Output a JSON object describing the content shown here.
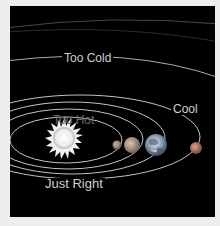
{
  "diagram": {
    "labels": {
      "too_cold": "Too Cold",
      "too_hot": "Too Hot",
      "just_right": "Just Right",
      "cool": "Cool"
    },
    "bodies": [
      {
        "name": "Sun",
        "color": "#f2f2f2"
      },
      {
        "name": "Mercury",
        "color": "#9a8a7a"
      },
      {
        "name": "Venus",
        "color": "#b09a88"
      },
      {
        "name": "Earth",
        "color": "#8fa0b8"
      },
      {
        "name": "Mars",
        "color": "#b07a60"
      }
    ],
    "colors": {
      "background": "#000000",
      "orbit": "#bdbdbd",
      "page": "#eeeeee"
    }
  }
}
